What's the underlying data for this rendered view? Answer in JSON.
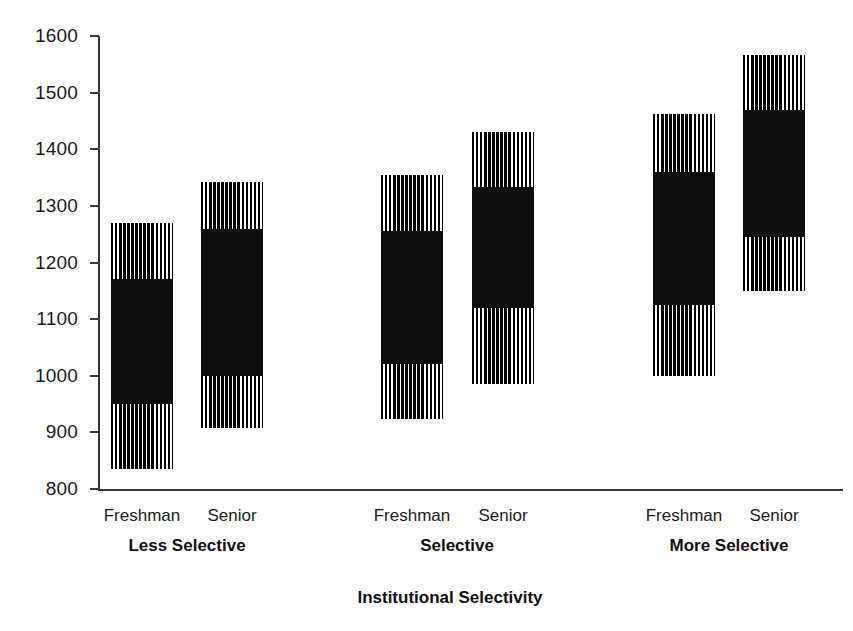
{
  "chart_data": {
    "type": "bar",
    "title": "",
    "subtitle": "",
    "xlabel": "Institutional Selectivity",
    "ylabel": "",
    "ylim": [
      800,
      1600
    ],
    "ytick_labels": [
      "1600",
      "1500",
      "1400",
      "1300",
      "1200",
      "1100",
      "1000",
      "900",
      "800"
    ],
    "yticks": [
      1600,
      1500,
      1400,
      1300,
      1200,
      1100,
      1000,
      900,
      800
    ],
    "grid": false,
    "legend": "none",
    "groups": [
      {
        "label": "Less Selective",
        "bars": [
          {
            "label": "Freshman",
            "min": 835,
            "box_low": 950,
            "box_high": 1170,
            "max": 1270
          },
          {
            "label": "Senior",
            "min": 908,
            "box_low": 1000,
            "box_high": 1260,
            "max": 1342
          }
        ]
      },
      {
        "label": "Selective",
        "bars": [
          {
            "label": "Freshman",
            "min": 924,
            "box_low": 1020,
            "box_high": 1255,
            "max": 1355
          },
          {
            "label": "Senior",
            "min": 985,
            "box_low": 1120,
            "box_high": 1333,
            "max": 1430
          }
        ]
      },
      {
        "label": "More Selective",
        "bars": [
          {
            "label": "Freshman",
            "min": 1000,
            "box_low": 1125,
            "box_high": 1360,
            "max": 1462
          },
          {
            "label": "Senior",
            "min": 1150,
            "box_low": 1245,
            "box_high": 1470,
            "max": 1567
          }
        ]
      }
    ]
  },
  "colors": {
    "bar_solid": "#0d0d0d",
    "bar_stripe": "#000000",
    "background": "#ffffff",
    "axis": "#3a3a3a",
    "text": "#1a1a1a"
  },
  "geometry": {
    "plot_left": 98,
    "plot_right": 843,
    "y_top_px": 36,
    "y_bottom_px": 489,
    "bar_width": 62,
    "bar_centers": [
      142,
      232,
      412,
      503,
      684,
      774
    ],
    "group_centers": [
      187,
      457,
      729
    ],
    "cat_label_y": 507,
    "group_label_y": 537,
    "axis_title_x": 450,
    "axis_title_y": 589
  }
}
